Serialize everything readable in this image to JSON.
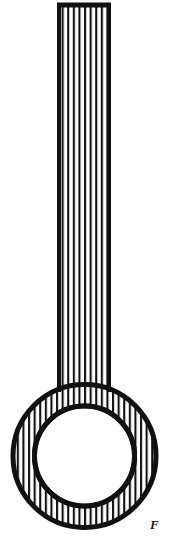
{
  "figure": {
    "title": "Hatched tube with annular ring",
    "caption_fragment": "F",
    "background_color": "#ffffff",
    "ink_color": "#111111",
    "hatch_color": "#111111",
    "outline_width_px": 4,
    "hatch_line_width_px": 2,
    "hatch_spacing_px": 5.6,
    "hatch_orientation": "vertical",
    "parts": [
      {
        "name": "stem",
        "shape": "rectangle",
        "x": 57,
        "y": 3,
        "width": 54,
        "height": 400,
        "fill": "vertical-hatch"
      },
      {
        "name": "annulus",
        "shape": "ring",
        "center_x": 84.5,
        "center_y": 456,
        "outer_radius": 73.5,
        "inner_radius": 50,
        "fill": "vertical-hatch"
      },
      {
        "name": "bore",
        "shape": "circle",
        "center_x": 84.5,
        "center_y": 456,
        "radius": 50,
        "fill": "#ffffff"
      }
    ]
  },
  "canvas": {
    "width": 169,
    "height": 555
  }
}
